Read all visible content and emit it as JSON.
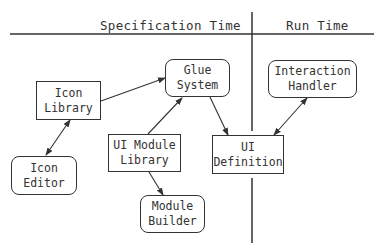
{
  "headers": {
    "spec_time": "Specification Time",
    "run_time": "Run Time"
  },
  "nodes": {
    "icon_library": {
      "line1": "Icon",
      "line2": "Library",
      "shape": "rect"
    },
    "icon_editor": {
      "line1": "Icon",
      "line2": "Editor",
      "shape": "rounded"
    },
    "glue_system": {
      "line1": "Glue",
      "line2": "System",
      "shape": "rounded"
    },
    "ui_module_library": {
      "line1": "UI Module",
      "line2": "Library",
      "shape": "rect"
    },
    "module_builder": {
      "line1": "Module",
      "line2": "Builder",
      "shape": "rounded"
    },
    "ui_definition": {
      "line1": "UI",
      "line2": "Definition",
      "shape": "rect"
    },
    "interaction_handler": {
      "line1": "Interaction",
      "line2": "Handler",
      "shape": "rounded"
    }
  },
  "edges": [
    {
      "from": "icon_library",
      "to": "icon_editor",
      "direction": "bidirectional"
    },
    {
      "from": "icon_library",
      "to": "glue_system",
      "direction": "forward"
    },
    {
      "from": "ui_module_library",
      "to": "glue_system",
      "direction": "forward"
    },
    {
      "from": "ui_module_library",
      "to": "module_builder",
      "direction": "forward"
    },
    {
      "from": "glue_system",
      "to": "ui_definition",
      "direction": "forward"
    },
    {
      "from": "ui_definition",
      "to": "interaction_handler",
      "direction": "bidirectional"
    }
  ],
  "colors": {
    "line": "#333333",
    "background": "#ffffff"
  }
}
